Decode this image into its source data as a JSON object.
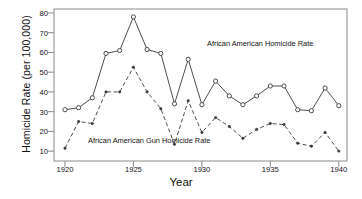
{
  "chart_data": {
    "type": "line",
    "title": "",
    "xlabel": "Year",
    "ylabel": "Homicide Rate (per 100,000)",
    "xlim": [
      1919.2,
      1940.6
    ],
    "ylim": [
      5,
      82
    ],
    "grid": false,
    "legend_position": "inline-annotations",
    "x": [
      1920,
      1921,
      1922,
      1923,
      1924,
      1925,
      1926,
      1927,
      1928,
      1929,
      1930,
      1931,
      1932,
      1933,
      1934,
      1935,
      1936,
      1937,
      1938,
      1939,
      1940
    ],
    "xticks": [
      1920,
      1925,
      1930,
      1935,
      1940
    ],
    "xtick_labels": [
      "1920",
      "1925",
      "1930",
      "1935",
      "1940"
    ],
    "yticks": [
      10,
      20,
      30,
      40,
      50,
      60,
      70,
      80
    ],
    "ytick_labels": [
      "10",
      "20",
      "30",
      "40",
      "50",
      "60",
      "70",
      "80"
    ],
    "series": [
      {
        "name": "African American Homicide Rate",
        "marker": "open-circle",
        "linestyle": "solid",
        "color": "#3a3a3a",
        "values": [
          31,
          32,
          37,
          59.5,
          61,
          78,
          61.5,
          59.5,
          34,
          56.5,
          33.5,
          45.5,
          38,
          33.5,
          38,
          43,
          43,
          31,
          30.5,
          42,
          33
        ]
      },
      {
        "name": "African American Gun Homicide Rate",
        "marker": "filled-dot",
        "linestyle": "dashed",
        "color": "#3a3a3a",
        "values": [
          11.5,
          25,
          24,
          40,
          40,
          52.5,
          40,
          31.5,
          13.5,
          35.5,
          19.5,
          27,
          22.5,
          16.5,
          21,
          24,
          23.5,
          14,
          12.5,
          19.5,
          10
        ]
      }
    ],
    "annotations": [
      {
        "text": "African American Homicide Rate",
        "x": 1936,
        "y": 66
      },
      {
        "text": "African American Gun Homicide Rate",
        "x": 1924,
        "y": 13
      }
    ]
  },
  "axes": {
    "xlabel": "Year",
    "ylabel": "Homicide Rate (per 100,000)"
  },
  "colors": {
    "line": "#3a3a3a",
    "frame": "#8a8a8a",
    "text": "#111111",
    "background": "#ffffff"
  }
}
